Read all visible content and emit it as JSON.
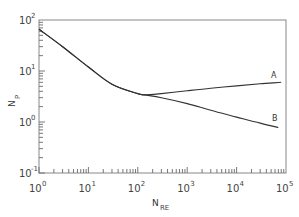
{
  "chart_data": {
    "type": "line",
    "title": "",
    "xlabel": "N_RE",
    "ylabel": "N_P",
    "xscale": "log",
    "yscale": "log",
    "xlim": [
      1,
      100000
    ],
    "ylim": [
      0.1,
      100
    ],
    "grid": false,
    "legend": "inline labels at curve ends",
    "x_ticks": [
      {
        "base": "10",
        "exp": "0"
      },
      {
        "base": "10",
        "exp": "1"
      },
      {
        "base": "10",
        "exp": "2"
      },
      {
        "base": "10",
        "exp": "3"
      },
      {
        "base": "10",
        "exp": "4"
      },
      {
        "base": "10",
        "exp": "5"
      }
    ],
    "y_ticks": [
      {
        "base": "10",
        "exp": "-1"
      },
      {
        "base": "10",
        "exp": "0"
      },
      {
        "base": "10",
        "exp": "1"
      },
      {
        "base": "10",
        "exp": "2"
      }
    ],
    "series": [
      {
        "name": "A",
        "x": [
          1,
          3,
          10,
          30,
          100,
          140,
          300,
          1000,
          3000,
          10000,
          30000,
          80000
        ],
        "y": [
          66,
          30,
          12,
          5.5,
          3.6,
          3.4,
          3.6,
          4.1,
          4.6,
          5.1,
          5.6,
          6.0
        ]
      },
      {
        "name": "B",
        "x": [
          1,
          3,
          10,
          30,
          100,
          140,
          300,
          1000,
          3000,
          10000,
          30000,
          70000
        ],
        "y": [
          66,
          30,
          12,
          5.5,
          3.6,
          3.4,
          3.0,
          2.3,
          1.7,
          1.25,
          0.95,
          0.78
        ]
      }
    ]
  },
  "labels": {
    "x_axis_main": "N",
    "x_axis_sub": "RE",
    "y_axis_main": "N",
    "y_axis_sub": "P",
    "curve_a": "A",
    "curve_b": "B"
  }
}
